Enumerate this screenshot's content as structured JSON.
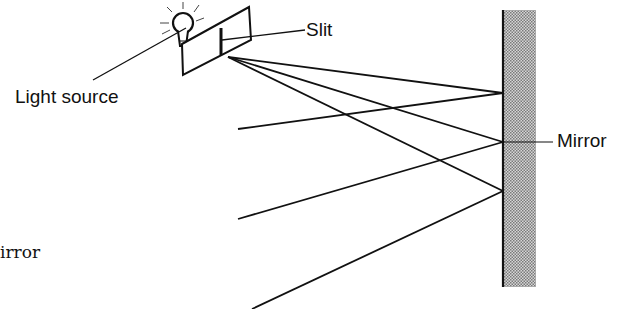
{
  "diagram": {
    "labels": {
      "slit": "Slit",
      "light_source": "Light source",
      "mirror": "Mirror",
      "caption_fragment": "irror"
    },
    "colors": {
      "ink": "#111111",
      "mirror_fill": "#b8b8b8",
      "background": "#ffffff"
    },
    "source_point": [
      228,
      57
    ],
    "mirror": {
      "x": 503,
      "top": 10,
      "bottom": 287,
      "width": 32
    },
    "rays": [
      {
        "from": [
          228,
          57
        ],
        "hit": [
          503,
          93
        ],
        "reflect_to": [
          238,
          129
        ]
      },
      {
        "from": [
          228,
          57
        ],
        "hit": [
          503,
          142
        ],
        "reflect_to": [
          238,
          219
        ]
      },
      {
        "from": [
          228,
          57
        ],
        "hit": [
          503,
          191
        ],
        "reflect_to": [
          252,
          308
        ]
      }
    ]
  }
}
